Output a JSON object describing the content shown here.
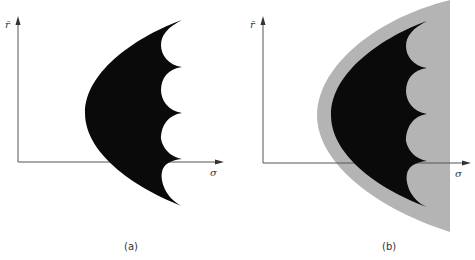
{
  "figure": {
    "panels": [
      {
        "id": "a",
        "caption": "(a)",
        "y_axis_label": "r̄",
        "x_axis_label": "σ",
        "regions": [
          {
            "name": "feasible-set",
            "color": "#0a0a0a",
            "shape": "parabolic region with scalloped right edge (4 concave arcs)"
          }
        ]
      },
      {
        "id": "b",
        "caption": "(b)",
        "y_axis_label": "r̄",
        "x_axis_label": "σ",
        "regions": [
          {
            "name": "enlarged-feasible-set",
            "color": "#b4b4b4",
            "shape": "parabolic region with straight right edge"
          },
          {
            "name": "feasible-set",
            "color": "#0a0a0a",
            "shape": "parabolic region with scalloped right edge (4 concave arcs)"
          }
        ]
      }
    ],
    "colors": {
      "axis": "#555555",
      "dark_region": "#0a0a0a",
      "light_region": "#b4b4b4"
    }
  }
}
